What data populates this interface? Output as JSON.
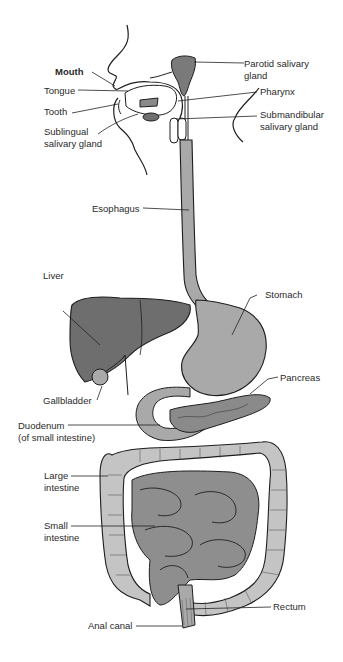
{
  "diagram": {
    "colors": {
      "liver": "#6e6e6e",
      "stomach": "#a9a9a9",
      "large_intestine": "#c4c4c4",
      "small_intestine": "#8e8e8e",
      "parotid": "#7a7a7a",
      "outline": "#1e1e1e",
      "background": "#ffffff"
    },
    "labels": {
      "mouth": "Mouth",
      "tongue": "Tongue",
      "tooth": "Tooth",
      "sublingual_1": "Sublingual",
      "sublingual_2": "salivary gland",
      "parotid_1": "Parotid salivary",
      "parotid_2": "gland",
      "pharynx": "Pharynx",
      "submandibular_1": "Submandibular",
      "submandibular_2": "salivary gland",
      "esophagus": "Esophagus",
      "liver": "Liver",
      "stomach": "Stomach",
      "gallbladder": "Gallbladder",
      "pancreas": "Pancreas",
      "duodenum_1": "Duodenum",
      "duodenum_2": "(of small intestine)",
      "large_intestine_1": "Large",
      "large_intestine_2": "intestine",
      "small_intestine_1": "Small",
      "small_intestine_2": "intestine",
      "rectum": "Rectum",
      "anal_canal": "Anal canal"
    }
  }
}
